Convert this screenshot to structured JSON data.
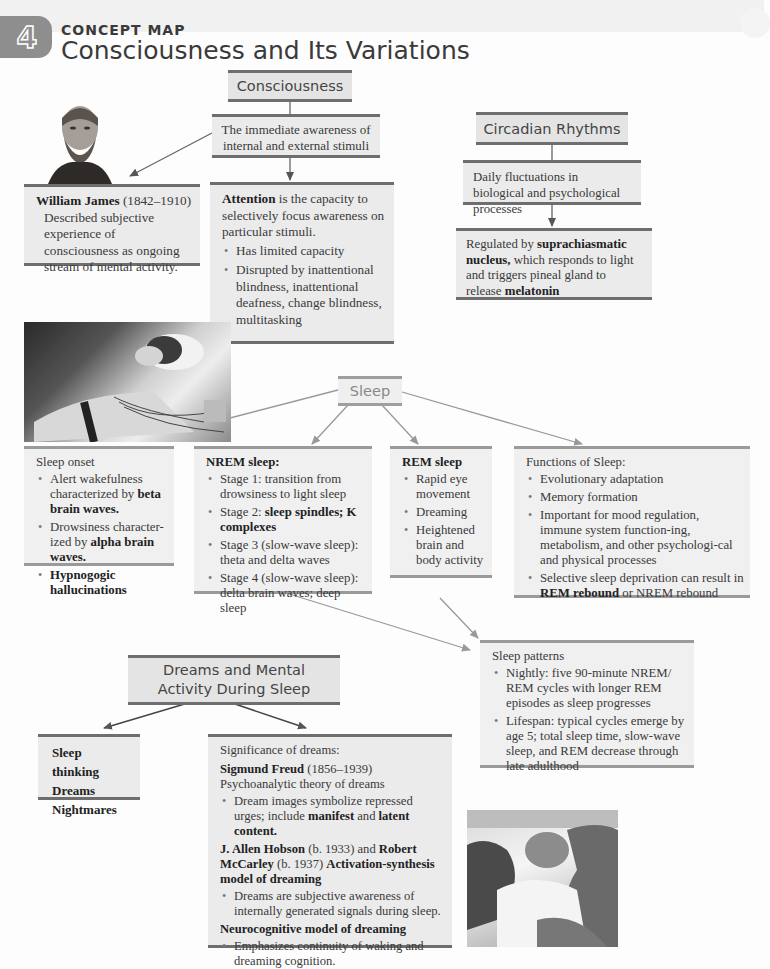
{
  "header": {
    "chapter_number": "4",
    "label": "CONCEPT MAP",
    "title": "Consciousness and Its Variations"
  },
  "consciousness": {
    "heading": "Consciousness",
    "definition": "The immediate awareness of internal and external stimuli",
    "william_james": {
      "name": "William James",
      "dates": "(1842–1910)",
      "text": "Described subjective experience of consciousness as ongoing stream of mental activity."
    },
    "attention": {
      "term": "Attention",
      "text": " is the capacity to selectively focus awareness on particular stimuli.",
      "bullets": [
        "Has limited capacity",
        "Disrupted by inattentional blindness, inattentional deafness, change blindness, multitasking"
      ]
    }
  },
  "circadian": {
    "heading": "Circadian Rhythms",
    "definition": "Daily fluctuations in biological and psychological processes",
    "regulation": {
      "pre": "Regulated by ",
      "term1": "suprachiasmatic nucleus,",
      "mid": " which responds to light and triggers pineal gland to release ",
      "term2": "melatonin"
    }
  },
  "sleep": {
    "heading": "Sleep",
    "onset": {
      "title": "Sleep onset",
      "b1_pre": "Alert wakefulness characterized by ",
      "b1_bold": "beta brain waves.",
      "b2_pre": "Drowsiness character-ized by ",
      "b2_bold": "alpha brain waves.",
      "b3_bold": "Hypnogogic hallucinations"
    },
    "nrem": {
      "title": "NREM sleep:",
      "s1": "Stage 1: transition from drowsiness to light sleep",
      "s2_pre": "Stage 2: ",
      "s2_bold": "sleep spindles; K complexes",
      "s3": "Stage 3 (slow-wave sleep): theta and delta waves",
      "s4": "Stage 4 (slow-wave sleep): delta brain waves; deep sleep"
    },
    "rem": {
      "title": "REM sleep",
      "bullets": [
        "Rapid eye movement",
        "Dreaming",
        "Heightened brain and body activity"
      ]
    },
    "functions": {
      "title": "Functions of Sleep:",
      "b1": "Evolutionary adaptation",
      "b2": "Memory formation",
      "b3": "Important for mood regulation, immune system function-ing, metabolism, and other psychologi-cal and physical processes",
      "b4_pre": "Selective sleep deprivation can result in ",
      "b4_bold": "REM rebound",
      "b4_post": " or NREM rebound"
    },
    "patterns": {
      "title": "Sleep patterns",
      "bullets": [
        "Nightly: five 90-minute NREM/ REM cycles with longer REM episodes as sleep progresses",
        "Lifespan: typical cycles emerge by age 5; total sleep time, slow-wave sleep, and REM decrease through late adulthood"
      ]
    }
  },
  "dreams": {
    "heading": "Dreams and Mental Activity During Sleep",
    "types": [
      "Sleep thinking",
      "Dreams",
      "Nightmares"
    ],
    "significance": {
      "title": "Significance of dreams:",
      "freud_name": "Sigmund Freud",
      "freud_dates": " (1856–1939)",
      "freud_theory": "Psychoanalytic theory of dreams",
      "freud_b_pre": "Dream images symbolize repressed urges; include ",
      "freud_b_bold1": "manifest",
      "freud_b_mid": " and ",
      "freud_b_bold2": "latent content.",
      "hobson_name": "J. Allen Hobson",
      "hobson_dates": " (b. 1933) and ",
      "mccarley_name": "Robert McCarley",
      "mccarley_dates": " (b. 1937) ",
      "activation_model": "Activation-synthesis model of dreaming",
      "activation_b": "Dreams are subjective awareness of internally generated signals during sleep.",
      "neuro_title": "Neurocognitive model of dreaming",
      "neuro_b": "Emphasizes continuity of waking and dreaming cognition."
    }
  },
  "photos": {
    "james": "Portrait of William James",
    "sleep_lab": "Person sleeping with electrodes attached",
    "parent_baby": "Parent sleeping with baby"
  }
}
